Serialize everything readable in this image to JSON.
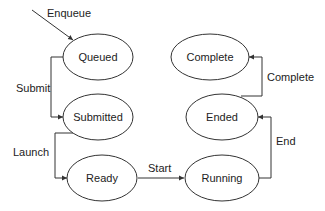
{
  "diagram": {
    "type": "state-diagram",
    "nodes": [
      {
        "id": "queued",
        "label": "Queued"
      },
      {
        "id": "submitted",
        "label": "Submitted"
      },
      {
        "id": "ready",
        "label": "Ready"
      },
      {
        "id": "running",
        "label": "Running"
      },
      {
        "id": "ended",
        "label": "Ended"
      },
      {
        "id": "complete",
        "label": "Complete"
      }
    ],
    "edges": [
      {
        "from": "",
        "to": "queued",
        "label": "Enqueue"
      },
      {
        "from": "queued",
        "to": "submitted",
        "label": "Submit"
      },
      {
        "from": "submitted",
        "to": "ready",
        "label": "Launch"
      },
      {
        "from": "ready",
        "to": "running",
        "label": "Start"
      },
      {
        "from": "running",
        "to": "ended",
        "label": "End"
      },
      {
        "from": "ended",
        "to": "complete",
        "label": "Complete"
      }
    ]
  },
  "colors": {
    "stroke": "#333333",
    "background": "#ffffff",
    "text": "#222222"
  }
}
